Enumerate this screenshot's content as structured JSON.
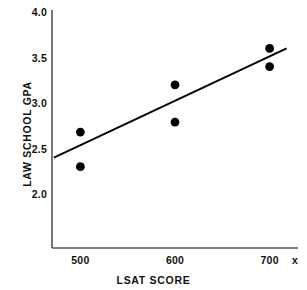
{
  "chart_data": {
    "type": "scatter",
    "title": "",
    "xlabel": "LSAT SCORE",
    "ylabel": "LAW SCHOOL GPA",
    "axis_end_label": "x",
    "xlim": [
      470,
      730
    ],
    "ylim": [
      1.78,
      4.0
    ],
    "xticks": [
      500,
      600,
      700
    ],
    "xtick_labels": [
      "500",
      "600",
      "700"
    ],
    "yticks": [
      2.0,
      2.5,
      3.0,
      3.5,
      4.0
    ],
    "ytick_labels": [
      "2.0",
      "2.5",
      "3.0",
      "3.5",
      "4.0"
    ],
    "grid": false,
    "legend": false,
    "marker_color": "#000000",
    "line_color": "#000000",
    "axis_color": "#444444",
    "points": [
      {
        "x": 500,
        "y": 2.68
      },
      {
        "x": 500,
        "y": 2.3
      },
      {
        "x": 600,
        "y": 3.2
      },
      {
        "x": 600,
        "y": 2.79
      },
      {
        "x": 700,
        "y": 3.6
      },
      {
        "x": 700,
        "y": 3.4
      }
    ],
    "trendline": {
      "name": "least-squares fit",
      "x_start": 472,
      "y_start": 2.4,
      "x_end": 718,
      "y_end": 3.6
    }
  }
}
